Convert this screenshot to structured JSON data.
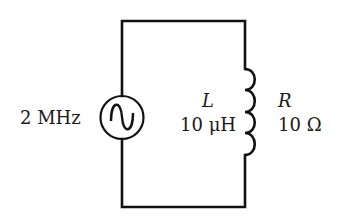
{
  "diagram": {
    "type": "circuit",
    "title": "",
    "source": {
      "kind": "ac-voltage-source",
      "icon": "sine-wave-icon",
      "frequency_label": "2 MHz"
    },
    "inductor": {
      "symbol": "L",
      "value": "10 μH"
    },
    "resistance": {
      "symbol": "R",
      "value": "10 Ω"
    },
    "colors": {
      "wire": "#111111",
      "background": "#ffffff"
    }
  }
}
